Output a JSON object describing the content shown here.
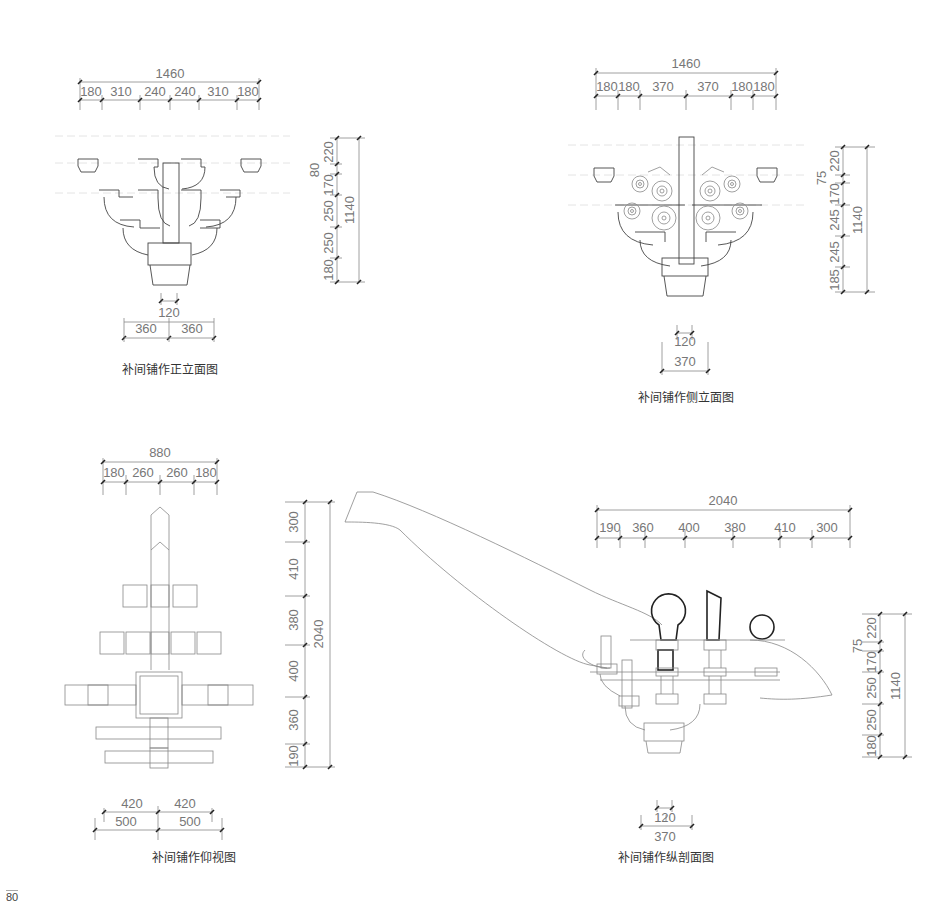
{
  "page": {
    "number": "80"
  },
  "drawings": [
    {
      "id": "front-elevation",
      "caption": "补间铺作正立面图",
      "top_dims": {
        "total": "1460",
        "segments": [
          "180",
          "310",
          "240",
          "240",
          "310",
          "180"
        ]
      },
      "right_dims": {
        "total": "1140",
        "segments": [
          "220",
          "80",
          "170",
          "250",
          "250",
          "180"
        ]
      },
      "bottom_dims": {
        "inner": "120",
        "segments": [
          "360",
          "360"
        ]
      }
    },
    {
      "id": "side-elevation",
      "caption": "补间铺作侧立面图",
      "top_dims": {
        "total": "1460",
        "segments": [
          "180",
          "180",
          "370",
          "370",
          "180",
          "180"
        ]
      },
      "right_dims": {
        "total": "1140",
        "segments": [
          "220",
          "75",
          "170",
          "245",
          "245",
          "185"
        ]
      },
      "bottom_dims": {
        "inner": "120",
        "outer": "370"
      }
    },
    {
      "id": "bottom-view",
      "caption": "补间铺作仰视图",
      "top_dims": {
        "total": "880",
        "segments": [
          "180",
          "260",
          "260",
          "180"
        ]
      },
      "right_dims": {
        "total": "2040",
        "segments": [
          "300",
          "410",
          "380",
          "400",
          "360",
          "190"
        ]
      },
      "bottom_dims": {
        "inner": [
          "420",
          "420"
        ],
        "outer": [
          "500",
          "500"
        ]
      }
    },
    {
      "id": "longitudinal-section",
      "caption": "补间铺作纵剖面图",
      "top_dims": {
        "total": "2040",
        "segments": [
          "190",
          "360",
          "400",
          "380",
          "410",
          "300"
        ]
      },
      "right_dims": {
        "total": "1140",
        "segments": [
          "220",
          "75",
          "170",
          "250",
          "250",
          "180"
        ]
      },
      "bottom_dims": {
        "inner": "120",
        "outer": "370"
      }
    }
  ]
}
